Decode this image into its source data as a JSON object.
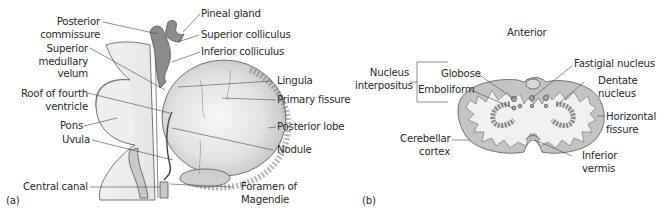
{
  "figure": {
    "panel_a": {
      "tag": "(a)",
      "labels": {
        "posterior_commissure": [
          "Posterior",
          "commissure"
        ],
        "superior_medullary_velum": [
          "Superior",
          "medullary",
          "velum"
        ],
        "roof_fourth_ventricle": [
          "Roof of fourth",
          "ventricle"
        ],
        "pons": "Pons",
        "uvula": "Uvula",
        "central_canal": "Central canal",
        "pineal_gland": "Pineal gland",
        "superior_colliculus": "Superior colliculus",
        "inferior_colliculus": "Inferior colliculus",
        "lingula": "Lingula",
        "primary_fissure": "Primary fissure",
        "posterior_lobe": "Posterior lobe",
        "nodule": "Nodule",
        "foramen_magendie": [
          "Foramen of",
          "Magendie"
        ]
      }
    },
    "panel_b": {
      "tag": "(b)",
      "labels": {
        "anterior": "Anterior",
        "nucleus_interpositus": [
          "Nucleus",
          "interpositus"
        ],
        "globose": "Globose",
        "emboliform": "Emboliform",
        "fastigial_nucleus": "Fastigial nucleus",
        "dentate_nucleus": [
          "Dentate",
          "nucleus"
        ],
        "horizontal_fissure": [
          "Horizontal",
          "fissure"
        ],
        "cerebellar_cortex": [
          "Cerebellar",
          "cortex"
        ],
        "inferior_vermis": [
          "Inferior",
          "vermis"
        ]
      }
    },
    "colors": {
      "line": "#3a3a3a",
      "dark_gray": "#8c8c8c",
      "mid_gray": "#bdbdbd",
      "light_gray": "#eeeeee",
      "text": "#2a2a2a"
    }
  }
}
